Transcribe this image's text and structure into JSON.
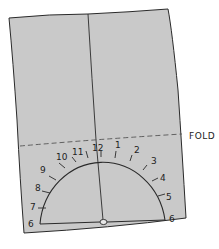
{
  "diagram": {
    "fold_label": "FOLD",
    "paper_color": "#c9c9c9",
    "line_color": "#2a2a2a",
    "dial": {
      "left_labels": [
        "6",
        "7",
        "8",
        "9",
        "10",
        "11"
      ],
      "top_label": "12",
      "right_labels": [
        "1",
        "2",
        "3",
        "4",
        "5",
        "6"
      ]
    }
  }
}
